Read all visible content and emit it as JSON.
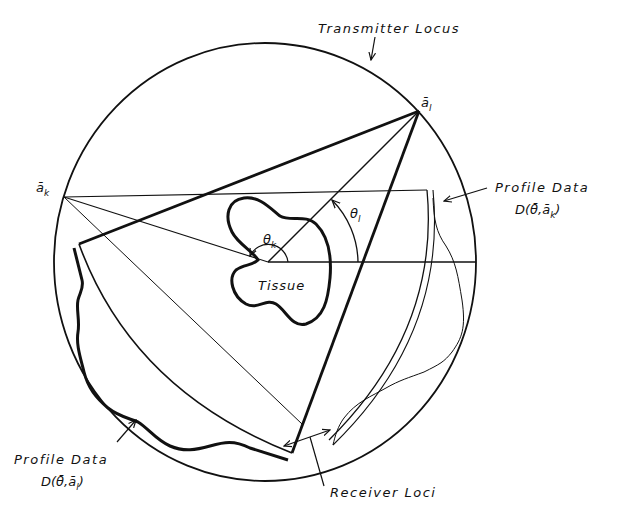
{
  "diagram": {
    "type": "tomography-geometry",
    "labels": {
      "transmitter_locus": "Transmitter Locus",
      "point_al": "ā",
      "point_al_sub": "l",
      "point_ak": "ā",
      "point_ak_sub": "k",
      "profile_k_title": "Profile Data",
      "profile_k_formula": "D(θ̄,ā",
      "profile_k_sub": "k",
      "profile_k_close": ")",
      "profile_l_title": "Profile Data",
      "profile_l_formula": "D(θ̄,ā",
      "profile_l_sub": "l",
      "profile_l_close": ")",
      "theta_k": "θ",
      "theta_k_sub": "k",
      "theta_l": "θ",
      "theta_l_sub": "l",
      "tissue": "Tissue",
      "receiver_loci": "Receiver Loci"
    },
    "colors": {
      "ink": "#111111",
      "background": "#ffffff"
    }
  }
}
